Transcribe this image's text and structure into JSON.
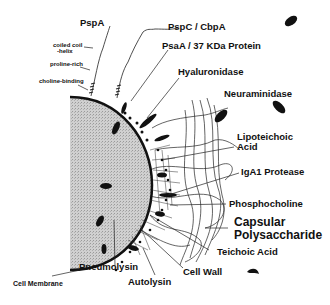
{
  "diagram": {
    "colors": {
      "cell_fill": "#c8c8c8",
      "membrane": "#111111",
      "ink": "#111111",
      "background": "#ffffff"
    },
    "labels": {
      "pspa": "PspA",
      "coiled_coil": "coiled coil",
      "coiled_coil_2": "-helix",
      "proline_rich": "proline-rich",
      "choline_binding": "choline-binding",
      "pspc": "PspC / CbpA",
      "psaa": "PsaA / 37 KDa Protein",
      "hyaluronidase": "Hyaluronidase",
      "neuraminidase": "Neuraminidase",
      "lipoteichoic": "Lipoteichoic",
      "lipoteichoic_2": "Acid",
      "iga1": "IgA1 Protease",
      "phosphocholine": "Phosphocholine",
      "capsular": "Capsular",
      "capsular_2": "Polysaccharide",
      "teichoic": "Teichoic Acid",
      "cell_wall": "Cell Wall",
      "autolysin": "Autolysin",
      "pneumolysin": "Pneumolysin",
      "cell_membrane": "Cell Membrane"
    }
  }
}
